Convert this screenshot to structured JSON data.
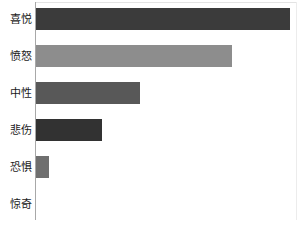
{
  "chart_data": {
    "type": "bar",
    "orientation": "horizontal",
    "title": "",
    "subtitle": "",
    "xlabel": "",
    "ylabel": "",
    "categories": [
      "喜悦",
      "愤怒",
      "中性",
      "悲伤",
      "恐惧",
      "惊奇"
    ],
    "values": [
      100,
      77,
      41,
      26,
      5,
      0
    ],
    "xlim": [
      0,
      100
    ],
    "grid": false,
    "legend": null,
    "bar_colors": [
      "#3b3b3b",
      "#8d8d8d",
      "#585858",
      "#323232",
      "#6f6f6f",
      "#6f6f6f"
    ],
    "axis_color": "#a8a8a8",
    "background": "#ffffff",
    "tick_labels_x": [],
    "tick_labels_y": [
      "喜悦",
      "愤怒",
      "中性",
      "悲伤",
      "恐惧",
      "惊奇"
    ],
    "annotations": []
  },
  "chart": {
    "plot_left_px": 36,
    "plot_width_px": 254,
    "row_pitch_px": 37,
    "row_top_px": 8,
    "bar_height_px": 22,
    "bars": [
      {
        "label": "喜悦",
        "value": 100,
        "color": "#3b3b3b"
      },
      {
        "label": "愤怒",
        "value": 77,
        "color": "#8d8d8d"
      },
      {
        "label": "中性",
        "value": 41,
        "color": "#585858"
      },
      {
        "label": "悲伤",
        "value": 26,
        "color": "#323232"
      },
      {
        "label": "恐惧",
        "value": 5,
        "color": "#6f6f6f"
      },
      {
        "label": "惊奇",
        "value": 0,
        "color": "#6f6f6f"
      }
    ]
  }
}
